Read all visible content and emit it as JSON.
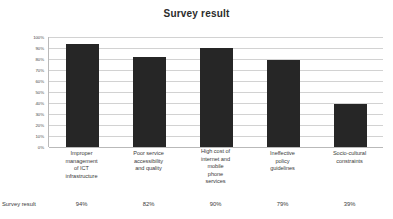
{
  "chart_data": {
    "type": "bar",
    "title": "Survey result",
    "xlabel": "",
    "ylabel": "",
    "ylim": [
      0,
      100
    ],
    "grid": true,
    "legend_position": "none",
    "categories": [
      "Improper management of ICT infrastructure",
      "Poor service accessibility and quality",
      "High cost of internet and mobile phone services",
      "Ineffective policy guidelines",
      "Socio-cultural constraints"
    ],
    "category_lines": [
      [
        "Improper",
        "management",
        "of ICT",
        "infrastructure"
      ],
      [
        "Poor service",
        "accessibility",
        "and quality"
      ],
      [
        "High cost of",
        "internet and",
        "mobile",
        "phone",
        "services"
      ],
      [
        "Ineffective",
        "policy",
        "guidelines"
      ],
      [
        "Socio-cultural",
        "constraints"
      ]
    ],
    "series": [
      {
        "name": "Survey result",
        "values": [
          94,
          82,
          90,
          79,
          39
        ],
        "value_labels": [
          "94%",
          "82%",
          "90%",
          "79%",
          "39%"
        ]
      }
    ],
    "y_ticks": [
      "100%",
      "90%",
      "80%",
      "70%",
      "60%",
      "50%",
      "40%",
      "30%",
      "20%",
      "10%",
      "0%"
    ],
    "y_tick_values": [
      100,
      90,
      80,
      70,
      60,
      50,
      40,
      30,
      20,
      10,
      0
    ],
    "colors": {
      "bar": "#262626",
      "gridline": "#d2d2d2",
      "axis": "#b9b9b9",
      "text": "#3a3a3a",
      "background": "#ffffff"
    }
  }
}
